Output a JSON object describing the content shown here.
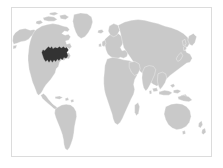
{
  "widget": {
    "name": "world-map-thumbnail",
    "title": "World map",
    "caption": ""
  },
  "colors": {
    "background": "#ffffff",
    "border": "#dcdcdc",
    "land": "#c9c9c9",
    "land_stroke": "#ffffff",
    "highlight": "#333333",
    "ocean": "#ffffff"
  },
  "map": {
    "projection": "equirectangular",
    "viewbox": "0 0 360 180",
    "lon_range": [
      -180,
      180
    ],
    "lat_range": [
      -60,
      85
    ],
    "regions": [
      {
        "id": "north-america",
        "label": "North America",
        "state": "normal"
      },
      {
        "id": "greenland",
        "label": "Greenland",
        "state": "normal"
      },
      {
        "id": "south-america",
        "label": "South America",
        "state": "normal"
      },
      {
        "id": "africa",
        "label": "Africa",
        "state": "normal"
      },
      {
        "id": "europe",
        "label": "Europe",
        "state": "normal"
      },
      {
        "id": "asia",
        "label": "Asia",
        "state": "normal"
      },
      {
        "id": "australia",
        "label": "Australia",
        "state": "normal"
      },
      {
        "id": "new-zealand",
        "label": "New Zealand",
        "state": "normal"
      },
      {
        "id": "japan",
        "label": "Japan",
        "state": "normal"
      },
      {
        "id": "indonesia",
        "label": "Indonesia",
        "state": "normal"
      },
      {
        "id": "madagascar",
        "label": "Madagascar",
        "state": "normal"
      },
      {
        "id": "british-isles",
        "label": "British Isles",
        "state": "normal"
      },
      {
        "id": "iceland",
        "label": "Iceland",
        "state": "normal"
      }
    ],
    "highlight": {
      "id": "us-great-lakes-northeast",
      "label": "Northeastern and Midwestern United States",
      "state": "selected",
      "color": "#333333"
    }
  }
}
